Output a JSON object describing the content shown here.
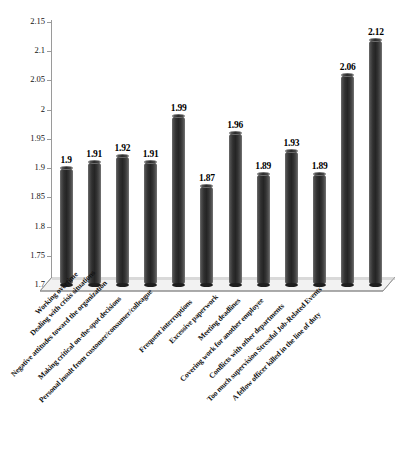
{
  "chart_data": {
    "type": "bar",
    "title": "",
    "subtitle": "",
    "xlabel": "",
    "ylabel": "",
    "ylim": [
      1.7,
      2.15
    ],
    "ytick_step": 0.05,
    "yticks": [
      "1.7",
      "1.75",
      "1.8",
      "1.85",
      "1.9",
      "1.95",
      "2",
      "2.05",
      "2.1",
      "2.15"
    ],
    "grid": false,
    "legend": "none",
    "style": "3d-cylinder",
    "bar_color": "#303030",
    "background_color": "#ffffff",
    "categories": [
      "Working overtime",
      "Dealing with crisis situations",
      "Negative attitudes toward the organization",
      "Making critical on-the-spot decisions",
      "Personal insult from customer/consumer/colleague",
      "Frequent interruptions",
      "Excessive paperwork",
      "Meeting deadlines",
      "Covering work for another employee",
      "Conflicts with other departments",
      "Too much supervision Stressful Job-Related Events",
      "A fellow officer killed in the line of duty"
    ],
    "values": [
      1.9,
      1.91,
      1.92,
      1.91,
      1.99,
      1.87,
      1.96,
      1.89,
      1.93,
      1.89,
      2.06,
      2.12
    ],
    "data_labels": [
      "1.9",
      "1.91",
      "1.92",
      "1.91",
      "1.99",
      "1.87",
      "1.96",
      "1.89",
      "1.93",
      "1.89",
      "2.06",
      "2.12"
    ]
  }
}
